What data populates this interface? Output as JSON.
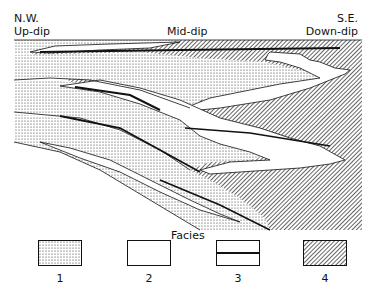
{
  "labels": {
    "nw": "N.W.",
    "updip": "Up-dip",
    "mid": "Mid-dip",
    "se": "S.E.",
    "downdip": "Down-dip"
  },
  "legend": {
    "title": "Facies",
    "items": [
      {
        "number": "1",
        "pattern": "stippled"
      },
      {
        "number": "2",
        "pattern": "blank"
      },
      {
        "number": "3",
        "pattern": "bold-horizontal-line"
      },
      {
        "number": "4",
        "pattern": "diagonal-hatch"
      }
    ]
  },
  "colors": {
    "ink": "#111111",
    "paper": "#ffffff"
  }
}
